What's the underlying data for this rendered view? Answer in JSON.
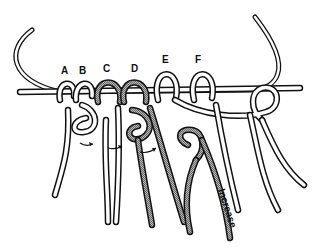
{
  "diagram": {
    "type": "knotting-illustration",
    "loop_labels": [
      "A",
      "B",
      "C",
      "D",
      "E",
      "F"
    ],
    "shaded_loops": [
      "C",
      "D"
    ],
    "annotation": "Increase",
    "arrows": 3,
    "colors": {
      "outline": "#111111",
      "cord_fill": "#ffffff",
      "shaded_cord": "#9a9a9a",
      "background": "#ffffff"
    }
  }
}
